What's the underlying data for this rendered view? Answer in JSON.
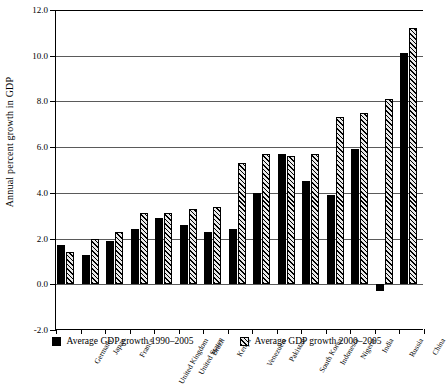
{
  "chart_data": {
    "type": "bar",
    "title": "",
    "xlabel": "",
    "ylabel": "Annual percent growth in GDP",
    "ylim": [
      -2.0,
      12.0
    ],
    "ytick_step": 2.0,
    "ytick_labels": [
      "12.0",
      "10.0",
      "8.0",
      "6.0",
      "4.0",
      "2.0",
      "0.0",
      "-2.0"
    ],
    "ytick_values": [
      12.0,
      10.0,
      8.0,
      6.0,
      4.0,
      2.0,
      0.0,
      -2.0
    ],
    "grid": "horizontal",
    "legend_position": "bottom",
    "categories": [
      "Germany",
      "Japan",
      "France",
      "United Kingdom",
      "United States",
      "Brazil",
      "Kenya",
      "Venezuela",
      "Pakistan",
      "South Korea",
      "Indonesia",
      "Nigeria",
      "India",
      "Russia",
      "China"
    ],
    "series": [
      {
        "name": "Average GDP growth 1990–2005",
        "style": "solid-black",
        "color": "#000000",
        "values": [
          1.7,
          1.3,
          1.9,
          2.4,
          2.9,
          2.6,
          2.3,
          2.4,
          4.0,
          5.7,
          4.5,
          3.9,
          5.9,
          -0.3,
          10.1
        ]
      },
      {
        "name": "Average GDP growth 2000–2005",
        "style": "hatched",
        "color": "#e9e9e9",
        "values": [
          1.4,
          2.0,
          2.3,
          3.1,
          3.1,
          3.3,
          3.4,
          5.3,
          5.7,
          5.6,
          5.7,
          7.3,
          7.5,
          8.1,
          11.2
        ]
      }
    ]
  },
  "legend": {
    "items": [
      {
        "label": "Average GDP growth 1990–2005"
      },
      {
        "label": "Average GDP growth 2000–2005"
      }
    ]
  }
}
